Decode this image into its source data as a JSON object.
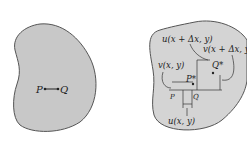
{
  "figure_left": {
    "point_p": "P",
    "point_q": "Q"
  },
  "figure_right": {
    "label_u_x_dx": "u(x + Δx, y)",
    "label_v_x_dx": "v(x + Δx, y)",
    "label_v_xy": "v(x, y)",
    "label_u_xy": "u(x, y)",
    "point_p_star": "P*",
    "point_q_star": "Q*",
    "point_p": "P",
    "point_q": "Q"
  },
  "colors": {
    "body_fill": "#c8c8c8",
    "outline": "#555555"
  }
}
